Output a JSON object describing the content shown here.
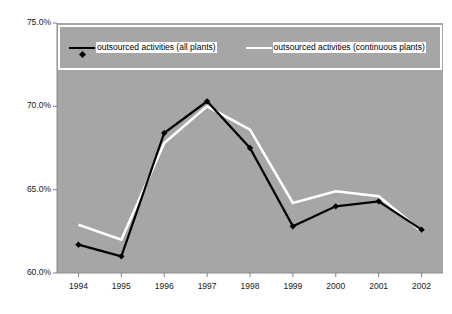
{
  "chart_data": {
    "type": "line",
    "title": "",
    "subtitle": "",
    "xlabel": "",
    "ylabel": "",
    "categories": [
      "1994",
      "1995",
      "1996",
      "1997",
      "1998",
      "1999",
      "2000",
      "2001",
      "2002"
    ],
    "x": [
      1994,
      1995,
      1996,
      1997,
      1998,
      1999,
      2000,
      2001,
      2002
    ],
    "series": [
      {
        "name": "outsourced activities (all plants)",
        "color": "#000000",
        "marker": "diamond",
        "values": [
          61.7,
          61.0,
          68.4,
          70.3,
          67.5,
          62.8,
          64.0,
          64.3,
          62.6
        ]
      },
      {
        "name": "outsourced activities (continuous plants)",
        "color": "#ffffff",
        "marker": "none",
        "values": [
          62.9,
          62.0,
          67.8,
          70.0,
          68.6,
          64.2,
          64.9,
          64.6,
          62.5
        ]
      }
    ],
    "ylim": [
      60.0,
      75.0
    ],
    "ytick_values": [
      75.0,
      70.0,
      65.0,
      60.0
    ],
    "ytick_labels": [
      "75.0%",
      "70.0%",
      "65.0%",
      "60.0%"
    ],
    "grid": false,
    "legend_position": "top-inside",
    "plot_background": "#a6a6a6",
    "figure_background": "#ffffff",
    "axis_color": "#808080",
    "legend_border_color": "#ffffff",
    "legend_text_background": "#ffffff"
  },
  "legend": {
    "entries": [
      {
        "label": "outsourced activities (all plants)"
      },
      {
        "label": "outsourced activities (continuous plants)"
      }
    ]
  }
}
